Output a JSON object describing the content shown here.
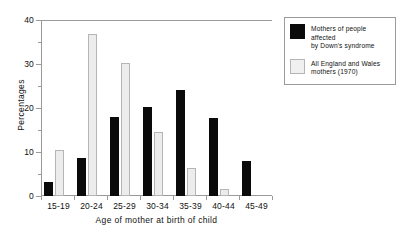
{
  "chart_data": {
    "type": "bar",
    "title": "",
    "xlabel": "Age of mother at birth of child",
    "ylabel": "Percentages",
    "categories": [
      "15-19",
      "20-24",
      "25-29",
      "30-34",
      "35-39",
      "40-44",
      "45-49"
    ],
    "series": [
      {
        "name": "Mothers of people affected by Down's syndrome",
        "color": "#0a0a0a",
        "values": [
          3.2,
          8.7,
          18.0,
          20.2,
          24.0,
          17.7,
          8.0
        ]
      },
      {
        "name": "All England and Wales mothers (1970)",
        "color": "#ececec",
        "values": [
          10.4,
          36.9,
          30.3,
          14.5,
          6.3,
          1.6,
          0.0
        ]
      }
    ],
    "ylim": [
      0,
      40
    ],
    "ytick_labels": [
      "0",
      "10",
      "20",
      "30",
      "40"
    ],
    "ytick_values": [
      0,
      10,
      20,
      30,
      40
    ],
    "yminor_values": [
      5,
      15,
      25,
      35
    ],
    "grid": false,
    "legend_position": "upper-right-outside"
  },
  "legend": {
    "entries": [
      {
        "swatch": "dark",
        "line1": "Mothers of people affected",
        "line2": "by Down's syndrome"
      },
      {
        "swatch": "light",
        "line1": "All England and Wales",
        "line2": "mothers (1970)"
      }
    ]
  }
}
